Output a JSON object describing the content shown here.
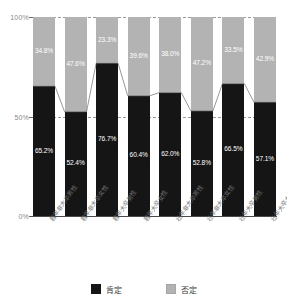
{
  "chart_data": {
    "type": "bar",
    "stacked": true,
    "stack_total": 100,
    "title": "",
    "subtitle": "",
    "xlabel": "",
    "ylabel": "",
    "ylim": [
      0,
      100
    ],
    "yticks": [
      0,
      50,
      100
    ],
    "ytick_labels": [
      "0%",
      "50%",
      "100%"
    ],
    "grid": "horizontal-dashed at 50% and 100%",
    "legend_position": "bottom-center",
    "categories": [
      "若年非大卒男性",
      "若年非大卒女性",
      "若年大卒男性",
      "若年大卒女性",
      "壮年非大卒男性",
      "壮年非大卒女性",
      "壮年大卒男性",
      "壮年大卒女性"
    ],
    "series": [
      {
        "name": "肯定",
        "color": "#151515",
        "values": [
          65.2,
          52.4,
          76.7,
          60.4,
          62.0,
          52.8,
          66.5,
          57.1
        ],
        "labels": [
          "65.2%",
          "52.4%",
          "76.7%",
          "60.4%",
          "62.0%",
          "52.8%",
          "66.5%",
          "57.1%"
        ]
      },
      {
        "name": "否定",
        "color": "#b3b3b3",
        "values": [
          34.8,
          47.6,
          23.3,
          39.6,
          38.0,
          47.2,
          33.5,
          42.9
        ],
        "labels": [
          "34.8%",
          "47.6%",
          "23.3%",
          "39.6%",
          "38.0%",
          "47.2%",
          "33.5%",
          "42.9%"
        ]
      }
    ],
    "annotations": {
      "connector_line": "thin line joining tops of 肯定 segments across adjacent bars"
    }
  },
  "axis": {
    "y_top": "100%",
    "y_mid": "50%",
    "y_bottom": "0%"
  },
  "legend": {
    "items": [
      {
        "label": "肯定",
        "swatch": "black-square-swatch"
      },
      {
        "label": "否定",
        "swatch": "gray-square-swatch"
      }
    ]
  },
  "colors": {
    "positive": "#151515",
    "negative": "#b3b3b3",
    "axis": "#4a4a4a",
    "grid": "#9a9a9a",
    "tick_text": "#8a8a8a",
    "category_text": "#6d6d6d"
  }
}
